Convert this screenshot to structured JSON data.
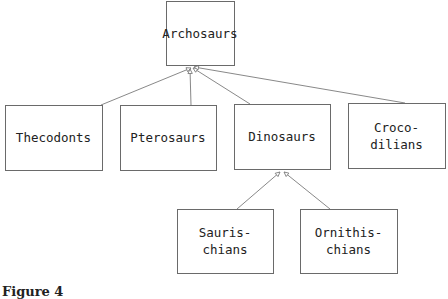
{
  "diagram": {
    "type": "inheritance-tree",
    "nodes": [
      {
        "id": "archosaurs",
        "lines": [
          "Archosaurs"
        ]
      },
      {
        "id": "thecodonts",
        "lines": [
          "Thecodonts"
        ]
      },
      {
        "id": "pterosaurs",
        "lines": [
          "Pterosaurs"
        ]
      },
      {
        "id": "dinosaurs",
        "lines": [
          "Dinosaurs"
        ]
      },
      {
        "id": "crocodilians",
        "lines": [
          "Croco-",
          "dilians"
        ]
      },
      {
        "id": "saurischians",
        "lines": [
          "Sauris-",
          "chians"
        ]
      },
      {
        "id": "ornithischians",
        "lines": [
          "Ornithis-",
          "chians"
        ]
      }
    ],
    "edges": [
      {
        "from": "thecodonts",
        "to": "archosaurs"
      },
      {
        "from": "pterosaurs",
        "to": "archosaurs"
      },
      {
        "from": "dinosaurs",
        "to": "archosaurs"
      },
      {
        "from": "crocodilians",
        "to": "archosaurs"
      },
      {
        "from": "saurischians",
        "to": "dinosaurs"
      },
      {
        "from": "ornithischians",
        "to": "dinosaurs"
      }
    ]
  },
  "caption": "Figure 4"
}
